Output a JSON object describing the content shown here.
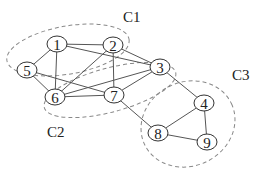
{
  "diagram": {
    "type": "graph-with-communities",
    "nodes": [
      {
        "id": "1",
        "label": "1",
        "x": 57,
        "y": 44
      },
      {
        "id": "2",
        "label": "2",
        "x": 113,
        "y": 45
      },
      {
        "id": "3",
        "label": "3",
        "x": 160,
        "y": 67
      },
      {
        "id": "4",
        "label": "4",
        "x": 204,
        "y": 103
      },
      {
        "id": "5",
        "label": "5",
        "x": 27,
        "y": 70
      },
      {
        "id": "6",
        "label": "6",
        "x": 55,
        "y": 97
      },
      {
        "id": "7",
        "label": "7",
        "x": 114,
        "y": 95
      },
      {
        "id": "8",
        "label": "8",
        "x": 158,
        "y": 133
      },
      {
        "id": "9",
        "label": "9",
        "x": 207,
        "y": 142
      }
    ],
    "edges": [
      [
        "1",
        "2"
      ],
      [
        "1",
        "3"
      ],
      [
        "1",
        "5"
      ],
      [
        "1",
        "6"
      ],
      [
        "2",
        "3"
      ],
      [
        "2",
        "6"
      ],
      [
        "2",
        "7"
      ],
      [
        "3",
        "6"
      ],
      [
        "3",
        "7"
      ],
      [
        "3",
        "4"
      ],
      [
        "5",
        "6"
      ],
      [
        "5",
        "7"
      ],
      [
        "6",
        "7"
      ],
      [
        "7",
        "8"
      ],
      [
        "8",
        "4"
      ],
      [
        "4",
        "9"
      ],
      [
        "8",
        "9"
      ]
    ],
    "clusters": [
      {
        "id": "C1",
        "label": "C1",
        "members": [
          "1",
          "2",
          "5"
        ]
      },
      {
        "id": "C2",
        "label": "C2",
        "members": [
          "3",
          "6",
          "7"
        ]
      },
      {
        "id": "C3",
        "label": "C3",
        "members": [
          "4",
          "8",
          "9"
        ]
      }
    ]
  }
}
